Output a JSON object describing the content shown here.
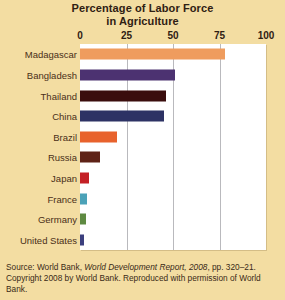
{
  "chart_data": {
    "type": "bar",
    "orientation": "horizontal",
    "title": "Percentage of Labor Force in Agriculture",
    "title_lines": [
      "Percentage of Labor Force",
      "in Agriculture"
    ],
    "xlabel": "",
    "ylabel": "",
    "xlim": [
      0,
      100
    ],
    "xticks": [
      0,
      25,
      50,
      75,
      100
    ],
    "xtick_labels": [
      "0",
      "25",
      "50",
      "75",
      "100"
    ],
    "grid": true,
    "grid_axis": "x",
    "legend": false,
    "categories": [
      "Madagascar",
      "Bangladesh",
      "Thailand",
      "China",
      "Brazil",
      "Russia",
      "Japan",
      "France",
      "Germany",
      "United States"
    ],
    "values": [
      78,
      51,
      46,
      45,
      20,
      11,
      5,
      4,
      3,
      2
    ],
    "bar_colors": [
      "#ef9c5e",
      "#4c3271",
      "#3a0d0d",
      "#2d3264",
      "#e8622c",
      "#5e2217",
      "#c42026",
      "#4ba2b8",
      "#5e8a42",
      "#3c3f7e"
    ]
  },
  "source": {
    "line1_prefix": "Source: World Bank, ",
    "line1_italic": "World Development Report, 2008",
    "line1_suffix": ", pp. 320–21.",
    "line2": "Copyright 2008 by World Bank. Reproduced with permission of World",
    "line3": "Bank."
  },
  "colors": {
    "page_background": "#f3dda2",
    "plot_background": "#ffffff",
    "gridline": "#b9b9bd",
    "title_text": "#2f2013",
    "label_text": "#4a2f18",
    "source_text": "#3a2a17"
  }
}
